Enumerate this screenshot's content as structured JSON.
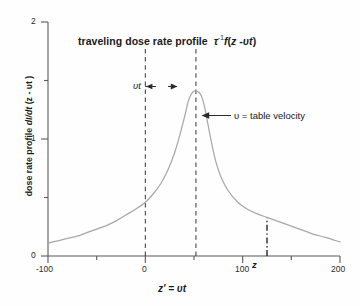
{
  "figure": {
    "title_plain": "traveling dose rate profile",
    "title_math_tau": "τ",
    "title_math_exp": "-1",
    "title_math_rest_f": "f",
    "title_math_open": "(",
    "title_math_z": "z",
    "title_math_minus": " -",
    "title_math_upsilon": "υ",
    "title_math_t": "t",
    "title_math_close": ")",
    "title_full": "traveling dose rate profile τ⁻¹f(z -υt)",
    "background_color": "#ffffff",
    "curve_color": "#a6a6a6",
    "axis_color": "#595959",
    "text_color": "#1a1a1a",
    "marker_line_color": "#262626"
  },
  "axes": {
    "y_title_pre": "dose rate profile ",
    "y_title_math": "dI/dt",
    "y_title_post": " (z - υt )",
    "y_title_full": "dose rate profile dI/dt (z - υt )",
    "x_title_z": "z",
    "x_title_prime": "'",
    "x_title_eq": " = ",
    "x_title_upsilon": "υ",
    "x_title_t": "t",
    "x_title_full": "z' = υt"
  },
  "annotations": {
    "vt_label": "υt",
    "velocity_label": "υ = table velocity",
    "z_marker_label": "z"
  },
  "chart_data": {
    "type": "line",
    "xlabel": "z' = υt",
    "ylabel": "dose rate profile dI/dt (z - υt )",
    "xlim": [
      -100,
      200
    ],
    "ylim": [
      0,
      2
    ],
    "xticks": [
      -100,
      0,
      100,
      200
    ],
    "xtick_labels": [
      "-100",
      "0",
      "100",
      "200"
    ],
    "xminorticks": [
      -50,
      50,
      150
    ],
    "yticks": [
      0,
      1,
      2
    ],
    "ytick_labels": [
      "0",
      "1",
      "2"
    ],
    "yminorticks": [
      0.5,
      1.5
    ],
    "grid": false,
    "legend": false,
    "peak_x": 52,
    "peak_y": 1.41,
    "series": [
      {
        "name": "traveling dose rate profile",
        "x": [
          -100,
          -90,
          -80,
          -70,
          -60,
          -50,
          -40,
          -30,
          -20,
          -10,
          0,
          8,
          16,
          24,
          30,
          35,
          40,
          44,
          47,
          50,
          52,
          55,
          58,
          61,
          64,
          68,
          72,
          78,
          85,
          95,
          105,
          115,
          125,
          135,
          145,
          155,
          165,
          175,
          185,
          200
        ],
        "y": [
          0.11,
          0.13,
          0.15,
          0.17,
          0.2,
          0.23,
          0.26,
          0.3,
          0.35,
          0.4,
          0.46,
          0.53,
          0.62,
          0.75,
          0.88,
          1.02,
          1.18,
          1.32,
          1.38,
          1.41,
          1.41,
          1.4,
          1.36,
          1.27,
          1.14,
          0.97,
          0.82,
          0.67,
          0.56,
          0.46,
          0.4,
          0.36,
          0.33,
          0.3,
          0.27,
          0.24,
          0.21,
          0.18,
          0.16,
          0.12
        ]
      }
    ],
    "vertical_lines": [
      {
        "name": "origin-dashed-line",
        "x": 0,
        "style": "dashed",
        "y_from": 0,
        "y_to": 1.78
      },
      {
        "name": "peak-dashed-line",
        "x": 52,
        "style": "dashed",
        "y_from": 0,
        "y_to": 1.78
      },
      {
        "name": "z-dashdot-line",
        "x": 125,
        "style": "dashdot",
        "y_from": 0,
        "y_to": 0.33
      }
    ],
    "arrow_annotations": [
      {
        "name": "vt-span-arrow",
        "label": "υt",
        "from_x": 0,
        "to_x": 52,
        "y": 1.45
      },
      {
        "name": "velocity-pointer-arrow",
        "label": "υ = table velocity",
        "from_x": 120,
        "to_x": 73,
        "y": 1.2
      }
    ]
  }
}
